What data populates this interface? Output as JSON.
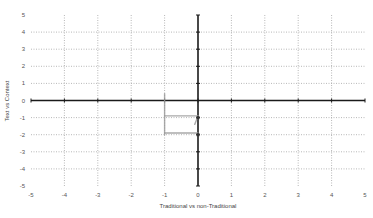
{
  "chart_data": {
    "type": "scatter",
    "title": "",
    "xlabel": "Traditional vs non-Traditional",
    "ylabel": "Text vs Context",
    "xlim": [
      -5,
      5
    ],
    "ylim": [
      -5,
      5
    ],
    "x_ticks": [
      "-5",
      "-4",
      "-3",
      "-2",
      "-1",
      "0",
      "1",
      "2",
      "3",
      "4",
      "5"
    ],
    "y_ticks": [
      "5",
      "4",
      "3",
      "2",
      "1",
      "0",
      "-1",
      "-2",
      "-3",
      "-4",
      "-5"
    ],
    "grid": true,
    "grid_style": "dotted",
    "legend": "none",
    "series": [
      {
        "name": "sketched-quadrant-mark",
        "color": "#9a9a9a",
        "style": "hand-drawn line",
        "segments": [
          [
            [
              -1,
              0.4
            ],
            [
              -1,
              -2.0
            ]
          ],
          [
            [
              -1,
              -0.9
            ],
            [
              0,
              -0.9
            ]
          ],
          [
            [
              -1,
              -1.9
            ],
            [
              0,
              -1.9
            ]
          ],
          [
            [
              0,
              -0.9
            ],
            [
              -0.1,
              -1.4
            ]
          ]
        ]
      },
      {
        "name": "points",
        "color": "#333333",
        "x": [
          0,
          0
        ],
        "y": [
          -1,
          -2
        ]
      }
    ],
    "axis_color": "#1a1a1a",
    "grid_color": "#9a9a9a"
  }
}
